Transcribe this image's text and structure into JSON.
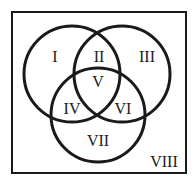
{
  "diagram": {
    "type": "venn-3-set",
    "universe_label": "VIII",
    "regions": [
      {
        "id": "I",
        "label": "I"
      },
      {
        "id": "II",
        "label": "II"
      },
      {
        "id": "III",
        "label": "III"
      },
      {
        "id": "IV",
        "label": "IV"
      },
      {
        "id": "V",
        "label": "V"
      },
      {
        "id": "VI",
        "label": "VI"
      },
      {
        "id": "VII",
        "label": "VII"
      },
      {
        "id": "VIII",
        "label": "VIII"
      }
    ],
    "colors": {
      "stroke": "#1a1a1a",
      "background": "#ffffff"
    }
  }
}
